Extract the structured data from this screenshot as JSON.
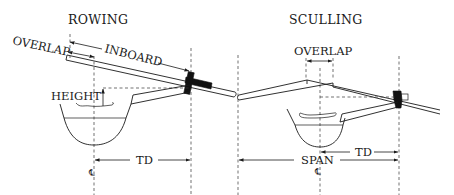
{
  "diagram": {
    "rowing": {
      "title": "ROWING",
      "labels": {
        "overlap": "OVERLAP",
        "inboard": "INBOARD",
        "height": "HEIGHT",
        "td": "TD",
        "centerline": "℄"
      }
    },
    "sculling": {
      "title": "SCULLING",
      "labels": {
        "overlap": "OVERLAP",
        "td": "TD",
        "span": "SPAN",
        "centerline": "℄"
      }
    },
    "colors": {
      "ink": "#1a1a1a",
      "background": "#ffffff"
    }
  }
}
